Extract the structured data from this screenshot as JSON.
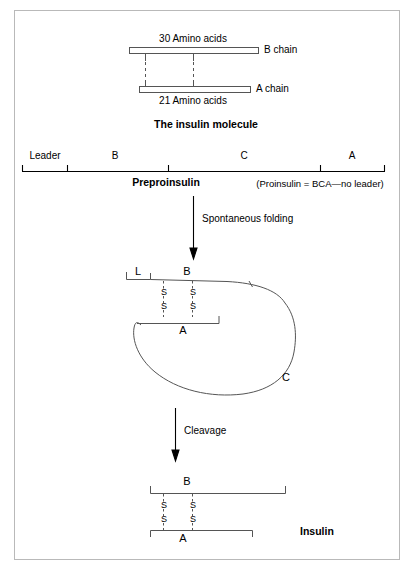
{
  "diagram": {
    "title_caption": "The insulin molecule",
    "top_panel": {
      "b_chain_length_label": "30 Amino acids",
      "b_chain_label": "B chain",
      "a_chain_length_label": "21 Amino acids",
      "a_chain_label": "A chain"
    },
    "preproinsulin": {
      "segments": [
        {
          "id": "leader",
          "label": "Leader"
        },
        {
          "id": "b",
          "label": "B"
        },
        {
          "id": "c",
          "label": "C"
        },
        {
          "id": "a",
          "label": "A"
        }
      ],
      "name_label": "Preproinsulin",
      "note_label": "(Proinsulin = BCA—no leader)"
    },
    "steps": [
      {
        "id": "folding",
        "label": "Spontaneous folding"
      },
      {
        "id": "cleavage",
        "label": "Cleavage"
      }
    ],
    "proinsulin_folded": {
      "leader_label": "L",
      "b_label": "B",
      "a_label": "A",
      "c_label": "C",
      "bond_labels": [
        "S",
        "S",
        "S",
        "S"
      ]
    },
    "insulin_final": {
      "b_label": "B",
      "a_label": "A",
      "name_label": "Insulin",
      "bond_labels": [
        "S",
        "S",
        "S",
        "S"
      ]
    },
    "colors": {
      "ink": "#000000",
      "line": "#555555",
      "frame": "#b9b9b9",
      "background": "#ffffff"
    }
  }
}
